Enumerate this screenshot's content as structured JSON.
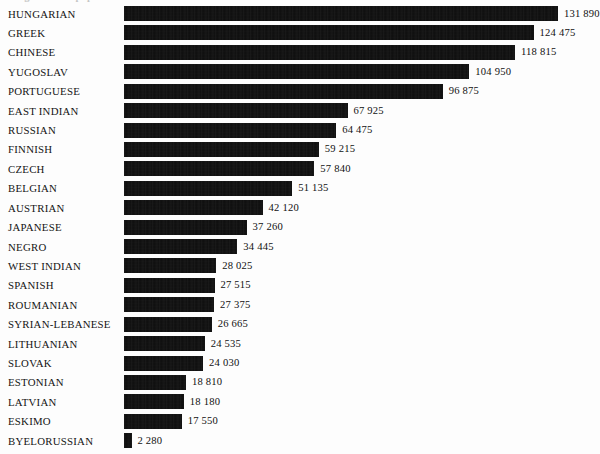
{
  "chart_title": "Origins of the population",
  "chart_data": {
    "type": "bar",
    "orientation": "horizontal",
    "title": "Origins of the population",
    "xlabel": "",
    "ylabel": "",
    "xlim": [
      0,
      131890
    ],
    "grid": false,
    "legend": null,
    "value_separator": " ",
    "bar_color": "#000000",
    "background_color": "#ffffff",
    "categories": [
      "HUNGARIAN",
      "GREEK",
      "CHINESE",
      "YUGOSLAV",
      "PORTUGUESE",
      "EAST INDIAN",
      "RUSSIAN",
      "FINNISH",
      "CZECH",
      "BELGIAN",
      "AUSTRIAN",
      "JAPANESE",
      "NEGRO",
      "WEST INDIAN",
      "SPANISH",
      "ROUMANIAN",
      "SYRIAN-LEBANESE",
      "LITHUANIAN",
      "SLOVAK",
      "ESTONIAN",
      "LATVIAN",
      "ESKIMO",
      "BYELORUSSIAN"
    ],
    "values": [
      131890,
      124475,
      118815,
      104950,
      96875,
      67925,
      64475,
      59215,
      57840,
      51135,
      42120,
      37260,
      34445,
      28025,
      27515,
      27375,
      26665,
      24535,
      24030,
      18810,
      18180,
      17550,
      2280
    ],
    "value_labels": [
      "131 890",
      "124 475",
      "118 815",
      "104 950",
      "96 875",
      "67 925",
      "64 475",
      "59 215",
      "57 840",
      "51 135",
      "42 120",
      "37 260",
      "34 445",
      "28 025",
      "27 515",
      "27 375",
      "26 665",
      "24 535",
      "24 030",
      "18 810",
      "18 180",
      "17 550",
      "2 280"
    ]
  }
}
